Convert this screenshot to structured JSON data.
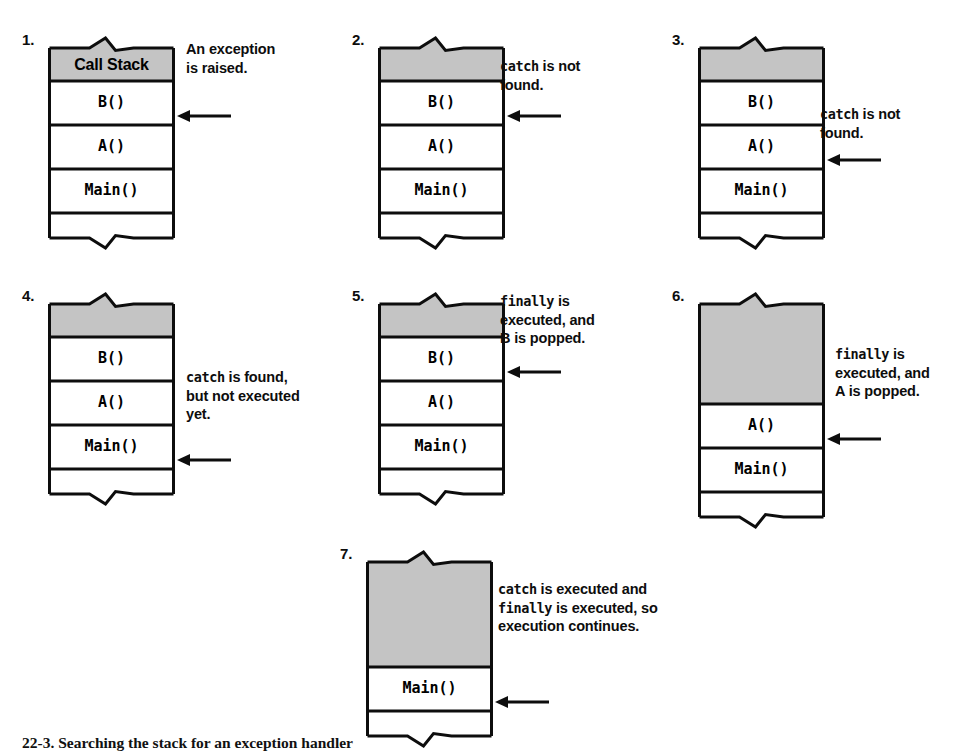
{
  "figure": {
    "caption": "22-3. Searching the stack for an exception handler",
    "colors": {
      "stroke": "#0d0d0d",
      "shaded_fill": "#c4c4c4",
      "empty_fill": "#ffffff",
      "text": "#0d0d0d"
    },
    "header_label": "Call Stack"
  },
  "panels": [
    {
      "number": "1.",
      "header": "Call Stack",
      "header_shaded": true,
      "frames": [
        "B()",
        "A()",
        "Main()"
      ],
      "shaded_top_rows": 0,
      "annotation_lines": [
        [
          {
            "t": "An exception",
            "code": false
          }
        ],
        [
          {
            "t": "is raised.",
            "code": false
          }
        ]
      ],
      "arrow_target_frame": "B()"
    },
    {
      "number": "2.",
      "header": "",
      "header_shaded": true,
      "frames": [
        "B()",
        "A()",
        "Main()"
      ],
      "shaded_top_rows": 1,
      "annotation_lines": [
        [
          {
            "t": "catch",
            "code": true
          },
          {
            "t": " is not",
            "code": false
          }
        ],
        [
          {
            "t": "found.",
            "code": false
          }
        ]
      ],
      "arrow_target_frame": "B()"
    },
    {
      "number": "3.",
      "header": "",
      "header_shaded": true,
      "frames": [
        "B()",
        "A()",
        "Main()"
      ],
      "shaded_top_rows": 1,
      "annotation_lines": [
        [
          {
            "t": "catch",
            "code": true
          },
          {
            "t": " is not",
            "code": false
          }
        ],
        [
          {
            "t": "found.",
            "code": false
          }
        ]
      ],
      "arrow_target_frame": "A()"
    },
    {
      "number": "4.",
      "header": "",
      "header_shaded": true,
      "frames": [
        "B()",
        "A()",
        "Main()"
      ],
      "shaded_top_rows": 1,
      "annotation_lines": [
        [
          {
            "t": "catch",
            "code": true
          },
          {
            "t": " is found,",
            "code": false
          }
        ],
        [
          {
            "t": "but not executed",
            "code": false
          }
        ],
        [
          {
            "t": "yet.",
            "code": false
          }
        ]
      ],
      "arrow_target_frame": "Main()"
    },
    {
      "number": "5.",
      "header": "",
      "header_shaded": true,
      "frames": [
        "B()",
        "A()",
        "Main()"
      ],
      "shaded_top_rows": 1,
      "annotation_lines": [
        [
          {
            "t": "finally",
            "code": true
          },
          {
            "t": " is",
            "code": false
          }
        ],
        [
          {
            "t": "executed, and",
            "code": false
          }
        ],
        [
          {
            "t": "B is popped.",
            "code": false
          }
        ]
      ],
      "arrow_target_frame": "B()"
    },
    {
      "number": "6.",
      "header": "",
      "header_shaded": true,
      "frames": [
        "A()",
        "Main()"
      ],
      "shaded_top_rows": 1,
      "annotation_lines": [
        [
          {
            "t": "finally",
            "code": true
          },
          {
            "t": " is",
            "code": false
          }
        ],
        [
          {
            "t": "executed, and",
            "code": false
          }
        ],
        [
          {
            "t": "A is popped.",
            "code": false
          }
        ]
      ],
      "arrow_target_frame": "A()"
    },
    {
      "number": "7.",
      "header": "",
      "header_shaded": true,
      "frames": [
        "Main()"
      ],
      "shaded_top_rows": 1,
      "annotation_lines": [
        [
          {
            "t": "catch",
            "code": true
          },
          {
            "t": " is executed and",
            "code": false
          }
        ],
        [
          {
            "t": "finally",
            "code": true
          },
          {
            "t": " is executed, so",
            "code": false
          }
        ],
        [
          {
            "t": "execution continues.",
            "code": false
          }
        ]
      ],
      "arrow_target_frame": "Main()"
    }
  ]
}
